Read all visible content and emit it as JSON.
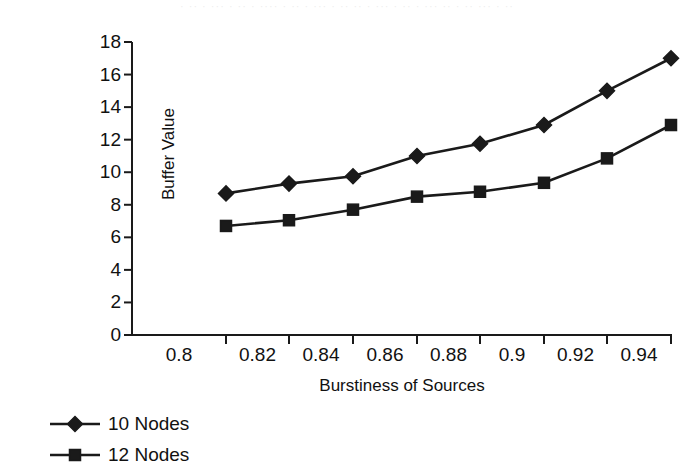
{
  "chart_data": {
    "type": "line",
    "title": "",
    "xlabel": "Burstiness of Sources",
    "ylabel": "Buffer Value",
    "categories": [
      "0.8",
      "0.82",
      "0.84",
      "0.86",
      "0.88",
      "0.9",
      "0.92",
      "0.94"
    ],
    "ylim": [
      0,
      18
    ],
    "ytick_step": 2,
    "yticks": [
      "0",
      "2",
      "4",
      "6",
      "8",
      "10",
      "12",
      "14",
      "16",
      "18"
    ],
    "grid": false,
    "legend_position": "bottom-left",
    "marker_color": "#1a1a1a",
    "line_color": "#1a1a1a",
    "series": [
      {
        "name": "10 Nodes",
        "marker": "diamond",
        "values": [
          8.7,
          9.3,
          9.75,
          11.0,
          11.75,
          12.9,
          15.0,
          17.0
        ]
      },
      {
        "name": "12 Nodes",
        "marker": "square",
        "values": [
          6.7,
          7.05,
          7.7,
          8.5,
          8.8,
          9.35,
          10.85,
          12.9
        ]
      }
    ]
  },
  "artifact": {
    "top_smudge": "· ·· · ··· · ·· · ···· · ·· · ··· · ·· ·· · ··· · ·· · ··· ·· · ·· ··· · ··"
  }
}
